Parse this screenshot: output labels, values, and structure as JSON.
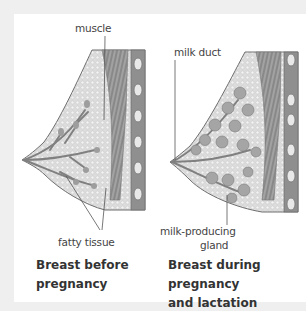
{
  "labels": {
    "muscle": "muscle",
    "fatty_tissue": "fatty tissue",
    "milk_duct": "milk duct",
    "milk_producing_1": "milk-producing",
    "milk_producing_2": "gland"
  },
  "captions": {
    "before_1": "Breast before",
    "before_2": "pregnancy",
    "during_1": "Breast during pregnancy",
    "during_2": "and lactation"
  },
  "colors": {
    "frame": "#efefef",
    "panel": "#ffffff",
    "tissue": "#d9d9d9",
    "muscle": "#8a8a8a",
    "outline": "#6f6f6f"
  }
}
